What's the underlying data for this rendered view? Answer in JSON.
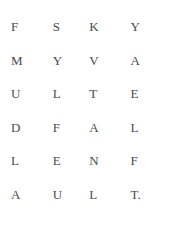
{
  "page": {
    "background_color": "#ffffff",
    "text_color": "#4a4a4a",
    "kind": "scanned-text-letter-grid",
    "columns": 4,
    "rows": 6
  },
  "grid": {
    "rows": [
      {
        "cells": [
          "F",
          "S",
          "K",
          "Y"
        ]
      },
      {
        "cells": [
          "M",
          "Y",
          "V",
          "A"
        ]
      },
      {
        "cells": [
          "U",
          "L",
          "T",
          "E"
        ]
      },
      {
        "cells": [
          "D",
          "F",
          "A",
          "L"
        ]
      },
      {
        "cells": [
          "L",
          "E",
          "N",
          "F"
        ]
      },
      {
        "cells": [
          "A",
          "U",
          "L",
          "T."
        ]
      }
    ],
    "columns_read_down": [
      "FMUDLA",
      "SYLFEU",
      "KVTANL",
      "YAELFT."
    ],
    "rows_read_across": [
      "FSKY",
      "MYVA",
      "ULTE",
      "DFAL",
      "LENF",
      "AULT."
    ]
  }
}
